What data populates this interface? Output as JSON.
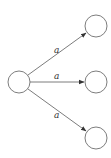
{
  "diagram": {
    "type": "state-transition-graph",
    "colors": {
      "stroke": "#6e6e6e",
      "edge": "#5a5a5a",
      "label": "#333333",
      "background": "#ffffff"
    },
    "nodes": [
      {
        "id": "source",
        "cx": 19,
        "cy": 82,
        "r": 11
      },
      {
        "id": "target-top",
        "cx": 96,
        "cy": 26,
        "r": 11
      },
      {
        "id": "target-middle",
        "cx": 96,
        "cy": 82,
        "r": 11
      },
      {
        "id": "target-bottom",
        "cx": 96,
        "cy": 138,
        "r": 11
      }
    ],
    "edges": [
      {
        "from": "source",
        "to": "target-top",
        "label": "a"
      },
      {
        "from": "source",
        "to": "target-middle",
        "label": "a"
      },
      {
        "from": "source",
        "to": "target-bottom",
        "label": "a"
      }
    ]
  }
}
